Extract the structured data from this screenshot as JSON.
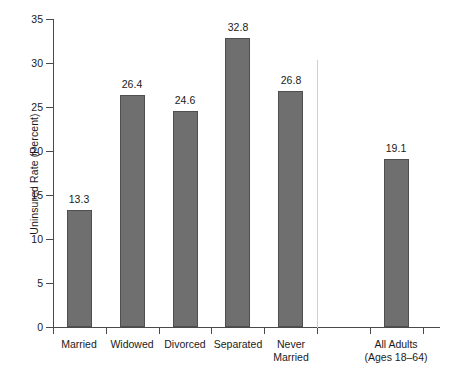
{
  "chart_data": {
    "type": "bar",
    "title": "",
    "xlabel": "",
    "ylabel": "Uninsured Rate (Percent)",
    "ylim": [
      0,
      35
    ],
    "yticks": [
      0,
      5,
      10,
      15,
      20,
      25,
      30,
      35
    ],
    "grid": false,
    "legend": null,
    "categories": [
      "Married",
      "Widowed",
      "Divorced",
      "Separated",
      "Never Married",
      "All Adults (Ages 18–64)"
    ],
    "values": [
      13.3,
      26.4,
      24.6,
      32.8,
      26.8,
      19.1
    ],
    "annotations": [
      "Vertical separator line divides the five marital-status categories from the All Adults total"
    ]
  },
  "axes": {
    "y_title": "Uninsured Rate (Percent)",
    "y_ticks": [
      {
        "value": 35,
        "label": "35"
      },
      {
        "value": 30,
        "label": "30"
      },
      {
        "value": 25,
        "label": "25"
      },
      {
        "value": 20,
        "label": "20"
      },
      {
        "value": 15,
        "label": "15"
      },
      {
        "value": 10,
        "label": "10"
      },
      {
        "value": 5,
        "label": "5"
      },
      {
        "value": 0,
        "label": "0"
      }
    ]
  },
  "bars": [
    {
      "id": "married",
      "value": 13.3,
      "value_label": "13.3",
      "label_line1": "Married",
      "label_line2": ""
    },
    {
      "id": "widowed",
      "value": 26.4,
      "value_label": "26.4",
      "label_line1": "Widowed",
      "label_line2": ""
    },
    {
      "id": "divorced",
      "value": 24.6,
      "value_label": "24.6",
      "label_line1": "Divorced",
      "label_line2": ""
    },
    {
      "id": "separated",
      "value": 32.8,
      "value_label": "32.8",
      "label_line1": "Separated",
      "label_line2": ""
    },
    {
      "id": "never-married",
      "value": 26.8,
      "value_label": "26.8",
      "label_line1": "Never",
      "label_line2": "Married"
    },
    {
      "id": "all-adults",
      "value": 19.1,
      "value_label": "19.1",
      "label_line1": "All Adults",
      "label_line2": "(Ages 18–64)"
    }
  ],
  "colors": {
    "bar_fill": "#6f6f6f",
    "bar_border": "#4f4f4f",
    "axis": "#4a4a4a",
    "separator": "#cfcfcf",
    "background": "#ffffff",
    "text": "#1a1a1a"
  }
}
